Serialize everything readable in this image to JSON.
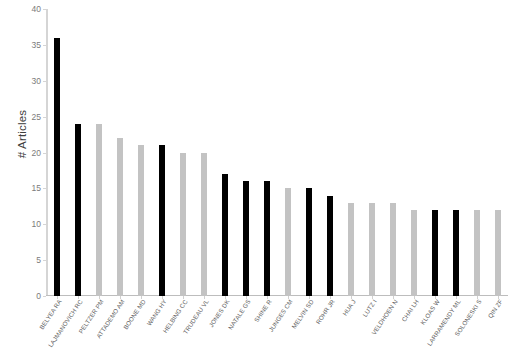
{
  "chart_data": {
    "type": "bar",
    "title": "",
    "subtitle": "",
    "xlabel": "",
    "ylabel": "# Articles",
    "ylim": [
      0,
      40
    ],
    "y_ticks": [
      0,
      5,
      10,
      15,
      20,
      25,
      30,
      35,
      40
    ],
    "grid": false,
    "legend": "none",
    "orientation": "vertical",
    "categories": [
      "BELYEA RA",
      "LAJMANOVICH RC",
      "PELTZER PM",
      "ATTADEMO AM",
      "BOONE MD",
      "WANG HY",
      "HELBING CC",
      "TRUDEAU VL",
      "JONES DK",
      "NATALE GS",
      "SHINE R",
      "JUNGES CM",
      "MELVIN SD",
      "ROHR JR",
      "HUA J",
      "LUTZ I",
      "VELDHOEN N",
      "CHAI LH",
      "KLOAS W",
      "LARRAMENDY ML",
      "SOLONESKI S",
      "QIN ZF"
    ],
    "values": [
      36,
      24,
      24,
      22,
      21,
      21,
      20,
      20,
      17,
      16,
      16,
      15,
      15,
      14,
      13,
      13,
      13,
      12,
      12,
      12,
      12,
      12
    ],
    "bar_colors": [
      "#000000",
      "#000000",
      "#c3c3c3",
      "#c3c3c3",
      "#c3c3c3",
      "#000000",
      "#c3c3c3",
      "#c3c3c3",
      "#000000",
      "#000000",
      "#000000",
      "#c3c3c3",
      "#000000",
      "#000000",
      "#c3c3c3",
      "#c3c3c3",
      "#c3c3c3",
      "#c3c3c3",
      "#000000",
      "#000000",
      "#c3c3c3",
      "#c3c3c3"
    ],
    "colors": {
      "black": "#000000",
      "gray": "#c3c3c3",
      "axis": "#d5d5d5",
      "tick_text": "#7b7b7b",
      "label_text": "#5d5d5d",
      "background": "#ffffff"
    }
  }
}
